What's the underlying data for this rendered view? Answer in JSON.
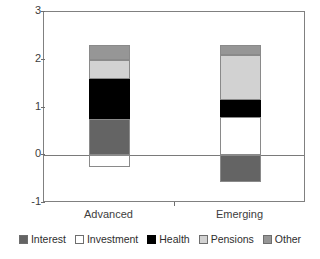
{
  "chart_data": {
    "type": "bar",
    "subtype": "stacked-bar-with-negatives",
    "title": "",
    "xlabel": "",
    "ylabel": "",
    "ylim": [
      -1,
      3
    ],
    "yticks": [
      3,
      2,
      1,
      0,
      -1
    ],
    "ytick_labels": [
      "3",
      "2",
      "1",
      "0",
      "-1"
    ],
    "grid": false,
    "zero_line": true,
    "legend_position": "bottom",
    "categories": [
      "Advanced",
      "Emerging"
    ],
    "series": [
      {
        "name": "Interest",
        "color": "#646464",
        "values": [
          0.75,
          -0.55
        ]
      },
      {
        "name": "Investment",
        "color": "#ffffff",
        "values": [
          -0.25,
          0.8
        ]
      },
      {
        "name": "Health",
        "color": "#000000",
        "values": [
          0.85,
          0.35
        ]
      },
      {
        "name": "Pensions",
        "color": "#d2d2d2",
        "values": [
          0.4,
          0.95
        ]
      },
      {
        "name": "Other",
        "color": "#969696",
        "values": [
          0.3,
          0.2
        ]
      }
    ],
    "stack_tops": [
      2.3,
      2.1
    ],
    "stack_bottoms": [
      -0.25,
      -0.55
    ]
  },
  "axis": {
    "y_ticks": [
      {
        "label": "3",
        "value": 3
      },
      {
        "label": "2",
        "value": 2
      },
      {
        "label": "1",
        "value": 1
      },
      {
        "label": "0",
        "value": 0
      },
      {
        "label": "-1",
        "value": -1
      }
    ],
    "x_ticks": [
      {
        "label": "Advanced"
      },
      {
        "label": "Emerging"
      }
    ]
  },
  "legend": {
    "items": [
      {
        "label": "Interest",
        "color": "#646464"
      },
      {
        "label": "Investment",
        "color": "#ffffff"
      },
      {
        "label": "Health",
        "color": "#000000"
      },
      {
        "label": "Pensions",
        "color": "#d2d2d2"
      },
      {
        "label": "Other",
        "color": "#969696"
      }
    ]
  },
  "colors": {
    "frame": "#808080",
    "zero_line": "#7a7a7a",
    "text": "#3d3d3d",
    "background": "#ffffff"
  }
}
